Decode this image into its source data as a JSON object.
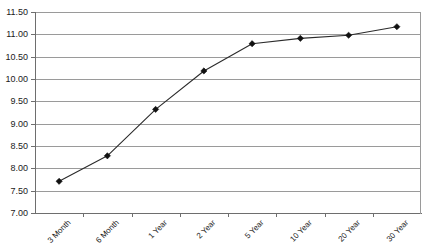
{
  "chart_data": {
    "type": "line",
    "title": "",
    "xlabel": "",
    "ylabel": "",
    "categories": [
      "3 Month",
      "6 Month",
      "1 Year",
      "2 Year",
      "5 Year",
      "10 Year",
      "20 Year",
      "30 Year"
    ],
    "values": [
      7.71,
      8.28,
      9.32,
      10.18,
      10.79,
      10.91,
      10.98,
      11.17
    ],
    "series": [
      {
        "name": "Yield",
        "values": [
          7.71,
          8.28,
          9.32,
          10.18,
          10.79,
          10.91,
          10.98,
          11.17
        ]
      }
    ],
    "ylim": [
      7.0,
      11.5
    ],
    "ytick_labels": [
      "11.50",
      "11.00",
      "10.50",
      "10.00",
      "9.50",
      "9.00",
      "8.50",
      "8.00",
      "7.50",
      "7.00"
    ],
    "ytick_values": [
      11.5,
      11.0,
      10.5,
      10.0,
      9.5,
      9.0,
      8.5,
      8.0,
      7.5,
      7.0
    ],
    "grid": true,
    "grid_axis": "y",
    "legend": "none",
    "marker": "diamond",
    "colors": {
      "line": "#2b2b2b",
      "marker": "#111111",
      "grid": "#9a9a9a",
      "axis": "#6e6e6e",
      "background": "#ffffff",
      "text": "#1a1a1a"
    }
  },
  "plot": {
    "left": 35,
    "right": 421,
    "top": 12,
    "bottom": 213
  }
}
